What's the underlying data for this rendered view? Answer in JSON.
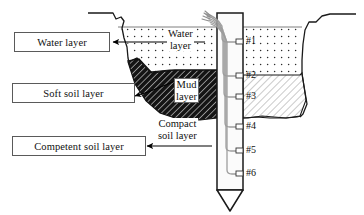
{
  "figure": {
    "type": "engineering-cross-section"
  },
  "callouts": [
    {
      "id": "water-layer",
      "label": "Water layer"
    },
    {
      "id": "soft-soil-layer",
      "label": "Soft soil layer"
    },
    {
      "id": "competent-soil-layer",
      "label": "Competent soil layer"
    }
  ],
  "inline_labels": [
    {
      "id": "water-layer-inline",
      "line1": "Water",
      "line2": "layer"
    },
    {
      "id": "mud-layer-inline",
      "line1": "Mud",
      "line2": "layer"
    },
    {
      "id": "compact-soil-layer-inline",
      "line1": "Compact",
      "line2": "soil layer"
    }
  ],
  "sensors": [
    {
      "id": "sensor-1",
      "label": "#1"
    },
    {
      "id": "sensor-2",
      "label": "#2"
    },
    {
      "id": "sensor-3",
      "label": "#3"
    },
    {
      "id": "sensor-4",
      "label": "#4"
    },
    {
      "id": "sensor-5",
      "label": "#5"
    },
    {
      "id": "sensor-6",
      "label": "#6"
    }
  ],
  "colors": {
    "outline": "#1a1a1a",
    "box_border": "#5a5a5a",
    "water_fill": "#ffffff",
    "water_dots": "#2b2b2b",
    "mud_fill": "#151515",
    "mud_hatch": "#ffffff",
    "competent_fill": "#ffffff",
    "competent_hatch": "#7a7a7a",
    "pile_fill": "#fbfbfb",
    "cable": "#9a9a9a",
    "arrow": "#000000",
    "background": "#ffffff"
  }
}
